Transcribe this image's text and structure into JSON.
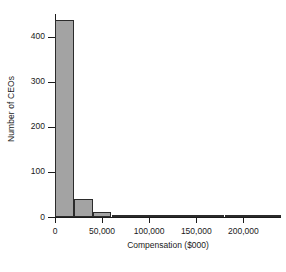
{
  "chart_data": {
    "type": "bar",
    "title": "",
    "xlabel": "Compensation ($000)",
    "ylabel": "Number of CEOs",
    "xlim": [
      0,
      240000
    ],
    "ylim": [
      0,
      450
    ],
    "grid": false,
    "legend": null,
    "bin_width": 20000,
    "x_ticks": [
      {
        "value": 0,
        "label": "0"
      },
      {
        "value": 50000,
        "label": "50,000"
      },
      {
        "value": 100000,
        "label": "100,000"
      },
      {
        "value": 150000,
        "label": "150,000"
      },
      {
        "value": 200000,
        "label": "200,000"
      }
    ],
    "y_ticks": [
      {
        "value": 0,
        "label": "0"
      },
      {
        "value": 100,
        "label": "100"
      },
      {
        "value": 200,
        "label": "200"
      },
      {
        "value": 300,
        "label": "300"
      },
      {
        "value": 400,
        "label": "400"
      }
    ],
    "bin_starts": [
      0,
      20000,
      40000,
      60000,
      80000,
      100000,
      120000,
      140000,
      160000,
      180000,
      200000,
      220000
    ],
    "categories": [
      "0-20,000",
      "20,000-40,000",
      "40,000-60,000",
      "60,000-80,000",
      "80,000-100,000",
      "100,000-120,000",
      "120,000-140,000",
      "140,000-160,000",
      "160,000-180,000",
      "180,000-200,000",
      "200,000-220,000",
      "220,000-240,000"
    ],
    "values": [
      437,
      40,
      12,
      3,
      3,
      0,
      2,
      2,
      0,
      0,
      0,
      2
    ],
    "bar_fill_color": "#a3a3a3",
    "bar_edge_color": "#2b2b2b",
    "background_color": "#ffffff",
    "axis_color": "#1c1c1c"
  }
}
